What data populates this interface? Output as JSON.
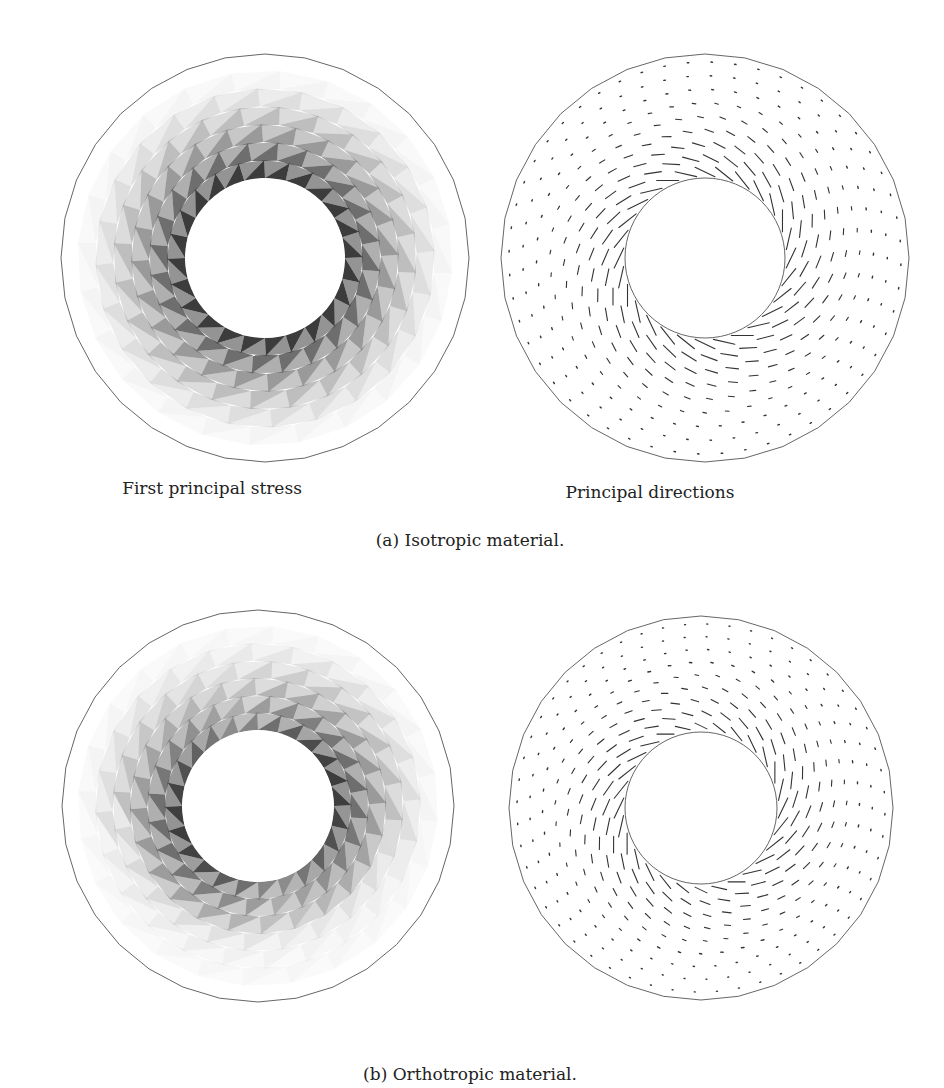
{
  "figure": {
    "rows": [
      {
        "caption": "(a) Isotropic material.",
        "caption_pos": [
          470,
          530
        ],
        "panels": [
          {
            "id": "a-stress",
            "kind": "stress",
            "label": "First principal stress",
            "label_pos": [
              212,
              478
            ],
            "center": [
              265,
              258
            ],
            "outer_r": 204,
            "inner_r": 80,
            "outer_sides": 32,
            "material": "isotropic"
          },
          {
            "id": "a-directions",
            "kind": "directions",
            "label": "Principal directions",
            "label_pos": [
              650,
              482
            ],
            "center": [
              705,
              258
            ],
            "outer_r": 204,
            "inner_r": 80,
            "outer_sides": 32,
            "material": "isotropic"
          }
        ]
      },
      {
        "caption": "(b) Orthotropic material.",
        "caption_pos": [
          470,
          1064
        ],
        "panels": [
          {
            "id": "b-stress",
            "kind": "stress",
            "label": "",
            "center": [
              258,
              806
            ],
            "outer_r": 196,
            "inner_r": 76,
            "outer_sides": 32,
            "material": "orthotropic"
          },
          {
            "id": "b-directions",
            "kind": "directions",
            "label": "",
            "center": [
              701,
              808
            ],
            "outer_r": 192,
            "inner_r": 76,
            "outer_sides": 32,
            "material": "orthotropic"
          }
        ]
      }
    ],
    "colors": {
      "outline": "#555555",
      "shade": "#1a1a1a",
      "ticks": "#333333"
    }
  }
}
